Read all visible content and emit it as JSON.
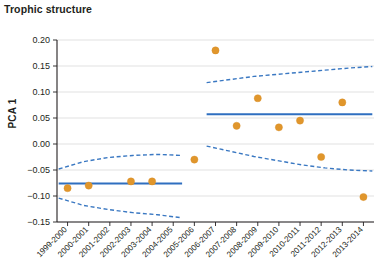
{
  "chart_title": "Trophic structure",
  "axes": {
    "ylabel": "PCA 1",
    "xlabel": "",
    "ylim": [
      -0.15,
      0.2
    ],
    "ytick_labels": [
      "0.20",
      "0.15",
      "0.10",
      "0.05",
      "0.00",
      "−0.05",
      "−0.10",
      "−0.15"
    ],
    "ytick_values": [
      0.2,
      0.15,
      0.1,
      0.05,
      0.0,
      -0.05,
      -0.1,
      -0.15
    ],
    "grid": "horizontal"
  },
  "colors": {
    "point": "#e0962c",
    "mean_line": "#2f6fc0",
    "ci_line": "#3a78c2",
    "grid": "#d9d9d9",
    "axis": "#231f20",
    "text": "#231f20",
    "background": "#ffffff"
  },
  "chart_data": {
    "type": "scatter",
    "title": "Trophic structure",
    "xlabel": "",
    "ylabel": "PCA 1",
    "ylim": [
      -0.15,
      0.2
    ],
    "grid": true,
    "legend": "none",
    "categories": [
      "1999-2000",
      "2000-2001",
      "2001-2002",
      "2002-2003",
      "2003-2004",
      "2004-2005",
      "2005-2006",
      "2006-2007",
      "2007-2008",
      "2008-2009",
      "2009-2010",
      "2010-2011",
      "2011-2012",
      "2012-2013",
      "2013-2014"
    ],
    "values": [
      -0.085,
      -0.08,
      null,
      -0.072,
      -0.072,
      null,
      -0.03,
      0.18,
      0.035,
      0.088,
      0.032,
      0.045,
      -0.025,
      0.08,
      -0.102
    ],
    "series": [
      {
        "name": "PCA 1 annual score",
        "values": [
          -0.085,
          -0.08,
          null,
          -0.072,
          -0.072,
          null,
          -0.03,
          0.18,
          0.035,
          0.088,
          0.032,
          0.045,
          -0.025,
          0.08,
          -0.102
        ]
      }
    ],
    "annotations": [
      {
        "kind": "regime-mean-line",
        "label": "Regime 1 mean",
        "x_from": "1999-2000",
        "x_to": "2004-2005",
        "value": -0.076
      },
      {
        "kind": "regime-mean-line",
        "label": "Regime 2 mean",
        "x_from": "2006-2007",
        "x_to": "2013-2014",
        "value": 0.057
      },
      {
        "kind": "confidence-band",
        "label": "Regime 1 95% CI",
        "x_from": "1999-2000",
        "x_to": "2004-2005",
        "upper": [
          -0.048,
          -0.034,
          -0.026,
          -0.022,
          -0.02,
          -0.022
        ],
        "lower": [
          -0.104,
          -0.118,
          -0.126,
          -0.132,
          -0.136,
          -0.142
        ]
      },
      {
        "kind": "confidence-band",
        "label": "Regime 2 95% CI",
        "x_from": "2006-2007",
        "x_to": "2013-2014",
        "upper": [
          0.118,
          0.124,
          0.13,
          0.134,
          0.138,
          0.142,
          0.146,
          0.149
        ],
        "lower": [
          -0.004,
          -0.014,
          -0.024,
          -0.032,
          -0.04,
          -0.046,
          -0.05,
          -0.052
        ]
      }
    ]
  }
}
